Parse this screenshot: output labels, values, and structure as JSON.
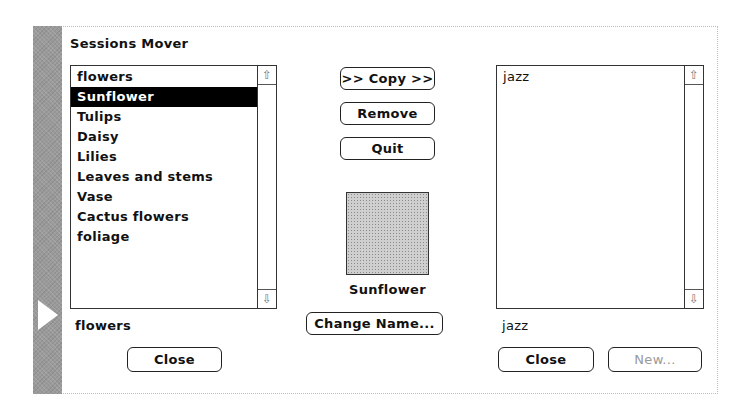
{
  "dialog": {
    "title": "Sessions Mover"
  },
  "left_panel": {
    "list_items": [
      "flowers",
      "Sunflower",
      "Tulips",
      "Daisy",
      "Lilies",
      "Leaves and stems",
      "Vase",
      "Cactus flowers",
      "foliage"
    ],
    "selected_index": 1,
    "current_name": "flowers",
    "close_label": "Close"
  },
  "center_panel": {
    "copy_label": ">> Copy >>",
    "remove_label": "Remove",
    "quit_label": "Quit",
    "preview_name": "Sunflower",
    "change_name_label": "Change Name..."
  },
  "right_panel": {
    "list_items": [
      "jazz"
    ],
    "current_name": "jazz",
    "close_label": "Close",
    "new_label": "New..."
  },
  "scroll_icons": {
    "up": "⇧",
    "down": "⇩"
  },
  "colors": {
    "strip": "#9a9a9a",
    "selection_bg": "#000000",
    "selection_fg": "#ffffff",
    "disabled_text": "#9a9a9a"
  }
}
